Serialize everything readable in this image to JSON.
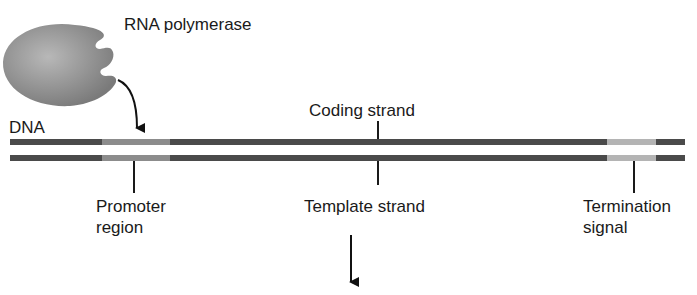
{
  "labels": {
    "rna_polymerase": "RNA polymerase",
    "dna": "DNA",
    "coding_strand": "Coding strand",
    "template_strand": "Template strand",
    "promoter": "Promoter",
    "promoter_line2": "region",
    "termination": "Termination",
    "termination_line2": "signal"
  },
  "colors": {
    "strand_dark": "#4a4a4a",
    "promoter": "#8c8c8c",
    "termination": "#b4b4b4",
    "polymerase": "#9a9a9a"
  }
}
